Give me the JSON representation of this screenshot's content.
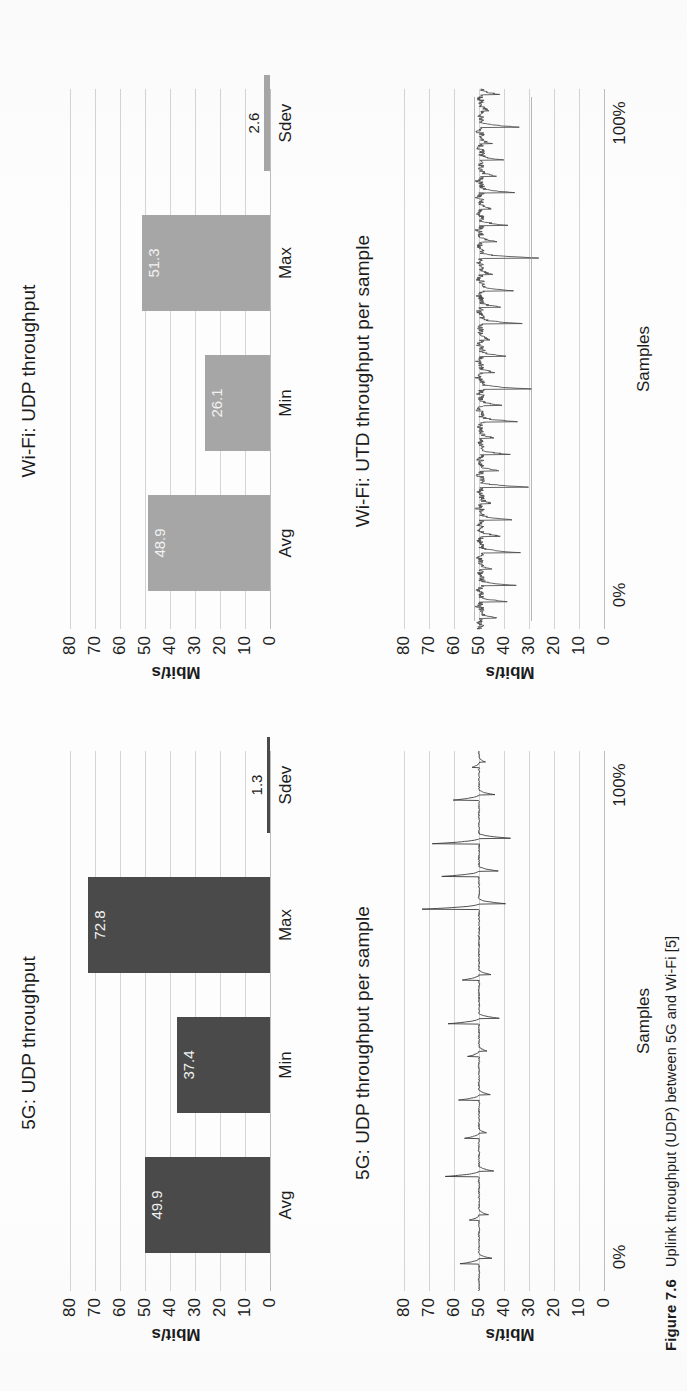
{
  "figure": {
    "number": "Figure 7.6",
    "caption": "Uplink throughput (UDP) between 5G and Wi-Fi [5]"
  },
  "axis": {
    "y_label": "Mbit/s",
    "y_ticks": [
      "80",
      "70",
      "60",
      "50",
      "40",
      "30",
      "20",
      "10",
      "0"
    ],
    "x_label_samples": "Samples",
    "x_tick_start": "0%",
    "x_tick_end": "100%"
  },
  "colors": {
    "bar_5g": "#4a4a4a",
    "bar_wifi": "#a6a6a6",
    "grid": "#d4d4d4",
    "text": "#1c1c1c"
  },
  "charts": [
    {
      "id": "5g-udp-throughput",
      "title": "5G: UDP throughput",
      "type": "bar"
    },
    {
      "id": "5g-udp-per-sample",
      "title": "5G: UDP throughput per sample",
      "type": "line"
    },
    {
      "id": "wifi-udp-throughput",
      "title": "Wi-Fi: UDP throughput",
      "type": "bar"
    },
    {
      "id": "wifi-utd-per-sample",
      "title": "Wi-Fi: UTD throughput per sample",
      "type": "line"
    }
  ],
  "chart_data": [
    {
      "type": "bar",
      "id": "5g-udp-throughput",
      "title": "5G: UDP throughput",
      "categories": [
        "Avg",
        "Min",
        "Max",
        "Sdev"
      ],
      "values": [
        49.9,
        37.4,
        72.8,
        1.3
      ],
      "labels": [
        "49.9",
        "37.4",
        "72.8",
        "1.3"
      ],
      "xlabel": "",
      "ylabel": "Mbit/s",
      "ylim": [
        0,
        80
      ],
      "yticks": [
        0,
        10,
        20,
        30,
        40,
        50,
        60,
        70,
        80
      ],
      "grid": true,
      "legend": "none",
      "color": "#4a4a4a"
    },
    {
      "type": "line",
      "id": "5g-udp-per-sample",
      "title": "5G: UDP throughput per sample",
      "xlabel": "Samples",
      "ylabel": "Mbit/s",
      "ylim": [
        0,
        80
      ],
      "yticks": [
        0,
        10,
        20,
        30,
        40,
        50,
        60,
        70,
        80
      ],
      "xticks": [
        "0%",
        "100%"
      ],
      "grid": true,
      "legend": "none",
      "color": "#3c3c3c",
      "baseline": 50.0,
      "note": "dense trace tightly centred on ~50 Mbit/s with periodic spikes to 58-73 and dips to 37-44",
      "x": [
        0,
        1,
        2,
        3,
        4,
        5,
        6,
        7,
        8,
        9,
        10,
        11,
        12,
        13,
        14,
        15,
        16,
        17,
        18,
        19,
        20,
        21,
        22,
        23,
        24,
        25,
        26,
        27,
        28,
        29,
        30,
        31,
        32,
        33,
        34,
        35,
        36,
        37,
        38,
        39,
        40,
        41,
        42,
        43,
        44,
        45,
        46,
        47,
        48,
        49,
        50,
        51,
        52,
        53,
        54,
        55,
        56,
        57,
        58,
        59,
        60,
        61,
        62,
        63,
        64,
        65,
        66,
        67,
        68,
        69,
        70,
        71,
        72,
        73,
        74,
        75,
        76,
        77,
        78,
        79,
        80,
        81,
        82,
        83,
        84,
        85,
        86,
        87,
        88,
        89,
        90,
        91,
        92,
        93,
        94,
        95,
        96,
        97,
        98,
        99
      ],
      "y": [
        50.1,
        49.8,
        50.2,
        49.9,
        50.0,
        57.6,
        44.8,
        50.1,
        49.9,
        50.0,
        50.2,
        49.7,
        50.1,
        53.9,
        46.2,
        50.0,
        49.9,
        50.1,
        50.0,
        49.8,
        50.2,
        63.5,
        44.1,
        50.0,
        50.1,
        49.9,
        50.0,
        50.2,
        55.8,
        47.0,
        50.1,
        49.9,
        50.0,
        50.1,
        49.8,
        58.2,
        45.5,
        50.0,
        50.2,
        49.9,
        50.0,
        50.1,
        49.8,
        54.6,
        46.8,
        50.0,
        50.1,
        49.9,
        50.2,
        62.4,
        41.9,
        50.0,
        49.9,
        50.1,
        50.0,
        50.2,
        49.8,
        56.7,
        45.2,
        50.1,
        49.9,
        50.0,
        50.1,
        49.9,
        50.0,
        50.2,
        49.8,
        50.1,
        50.0,
        49.9,
        72.8,
        39.4,
        50.1,
        49.9,
        50.0,
        50.2,
        64.9,
        42.3,
        50.0,
        50.1,
        49.9,
        50.0,
        68.7,
        37.4,
        50.1,
        49.9,
        50.0,
        50.2,
        49.8,
        50.1,
        60.3,
        43.6,
        50.0,
        49.9,
        50.1,
        50.0,
        52.8,
        47.4,
        50.1,
        49.9
      ]
    },
    {
      "type": "bar",
      "id": "wifi-udp-throughput",
      "title": "Wi-Fi: UDP throughput",
      "categories": [
        "Avg",
        "Min",
        "Max",
        "Sdev"
      ],
      "values": [
        48.9,
        26.1,
        51.3,
        2.6
      ],
      "labels": [
        "48.9",
        "26.1",
        "51.3",
        "2.6"
      ],
      "xlabel": "",
      "ylabel": "Mbit/s",
      "ylim": [
        0,
        80
      ],
      "yticks": [
        0,
        10,
        20,
        30,
        40,
        50,
        60,
        70,
        80
      ],
      "grid": true,
      "legend": "none",
      "color": "#a6a6a6"
    },
    {
      "type": "line",
      "id": "wifi-utd-per-sample",
      "title": "Wi-Fi: UTD throughput per sample",
      "xlabel": "Samples",
      "ylabel": "Mbit/s",
      "ylim": [
        0,
        80
      ],
      "yticks": [
        0,
        10,
        20,
        30,
        40,
        50,
        60,
        70,
        80
      ],
      "xticks": [
        "0%",
        "100%"
      ],
      "grid": true,
      "legend": "none",
      "color": "#4a4a4a",
      "baseline": 49.0,
      "note": "very noisy dense trace around 48-51 Mbit/s with frequent downward excursions to 33-44 and occasional drops near 26-30",
      "x": [
        0,
        1,
        2,
        3,
        4,
        5,
        6,
        7,
        8,
        9,
        10,
        11,
        12,
        13,
        14,
        15,
        16,
        17,
        18,
        19,
        20,
        21,
        22,
        23,
        24,
        25,
        26,
        27,
        28,
        29,
        30,
        31,
        32,
        33,
        34,
        35,
        36,
        37,
        38,
        39,
        40,
        41,
        42,
        43,
        44,
        45,
        46,
        47,
        48,
        49,
        50,
        51,
        52,
        53,
        54,
        55,
        56,
        57,
        58,
        59,
        60,
        61,
        62,
        63,
        64,
        65,
        66,
        67,
        68,
        69,
        70,
        71,
        72,
        73,
        74,
        75,
        76,
        77,
        78,
        79,
        80,
        81,
        82,
        83,
        84,
        85,
        86,
        87,
        88,
        89,
        90,
        91,
        92,
        93,
        94,
        95,
        96,
        97,
        98,
        99
      ],
      "y": [
        49.8,
        50.5,
        43.2,
        48.9,
        51.0,
        38.7,
        49.4,
        50.8,
        35.1,
        48.6,
        50.2,
        44.8,
        49.9,
        51.1,
        33.4,
        48.2,
        50.6,
        41.5,
        49.7,
        50.9,
        36.8,
        48.8,
        51.2,
        45.3,
        49.1,
        50.4,
        30.2,
        48.5,
        50.9,
        42.1,
        49.6,
        51.0,
        37.5,
        48.9,
        50.3,
        44.0,
        49.2,
        50.7,
        34.6,
        48.4,
        51.1,
        40.8,
        49.5,
        50.2,
        28.9,
        48.7,
        50.8,
        43.7,
        49.0,
        50.5,
        39.2,
        48.3,
        51.0,
        45.6,
        49.8,
        50.1,
        32.7,
        48.6,
        50.9,
        41.3,
        49.3,
        50.6,
        36.2,
        48.8,
        51.2,
        44.5,
        49.1,
        50.3,
        26.1,
        48.2,
        50.7,
        42.8,
        49.6,
        51.0,
        38.4,
        48.9,
        50.4,
        45.1,
        49.2,
        50.8,
        35.7,
        48.5,
        51.1,
        43.0,
        49.7,
        50.2,
        40.1,
        48.3,
        50.9,
        44.6,
        49.4,
        51.0,
        33.9,
        48.7,
        50.5,
        46.0,
        49.0,
        50.6,
        41.7,
        49.3
      ]
    }
  ]
}
